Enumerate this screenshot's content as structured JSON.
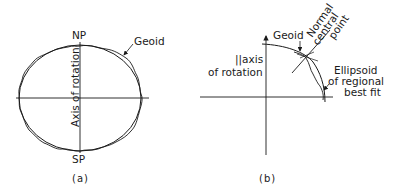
{
  "figure_a": {
    "north_pole": "NP",
    "south_pole": "SP",
    "geoid_label": "Geoid",
    "axis_label": "Axis of rotation",
    "caption": "(a)"
  },
  "figure_b": {
    "geoid_label": "Geoid",
    "axis_label_line1": "||axis",
    "axis_label_line2": "of rotation",
    "normal_label_line1": "Normal",
    "normal_label_line2": "central",
    "normal_label_line3": "point",
    "ellipsoid_label_line1": "Ellipsoid",
    "ellipsoid_label_line2": "of regional",
    "ellipsoid_label_line3": "best fit",
    "caption": "(b)"
  },
  "colors": {
    "ink": "#1a1a1a",
    "background": "#ffffff"
  }
}
